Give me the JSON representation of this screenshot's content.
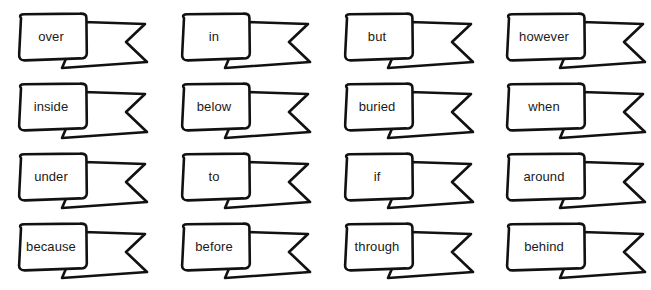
{
  "page": {
    "background_color": "#ffffff",
    "ink_color": "#111111",
    "text_color": "#1a1a1a",
    "columns": 4,
    "rows": 4
  },
  "banners": [
    {
      "id": "banner-over",
      "label": "over",
      "row": 1,
      "col": 1,
      "x": 14,
      "y": 12,
      "wide": false
    },
    {
      "id": "banner-in",
      "label": "in",
      "row": 1,
      "col": 2,
      "x": 177,
      "y": 12,
      "wide": false
    },
    {
      "id": "banner-but",
      "label": "but",
      "row": 1,
      "col": 3,
      "x": 340,
      "y": 12,
      "wide": false
    },
    {
      "id": "banner-however",
      "label": "however",
      "row": 1,
      "col": 4,
      "x": 502,
      "y": 12,
      "wide": true
    },
    {
      "id": "banner-inside",
      "label": "inside",
      "row": 2,
      "col": 1,
      "x": 14,
      "y": 82,
      "wide": false
    },
    {
      "id": "banner-below",
      "label": "below",
      "row": 2,
      "col": 2,
      "x": 177,
      "y": 82,
      "wide": false
    },
    {
      "id": "banner-buried",
      "label": "buried",
      "row": 2,
      "col": 3,
      "x": 340,
      "y": 82,
      "wide": false
    },
    {
      "id": "banner-when",
      "label": "when",
      "row": 2,
      "col": 4,
      "x": 502,
      "y": 82,
      "wide": true
    },
    {
      "id": "banner-under",
      "label": "under",
      "row": 3,
      "col": 1,
      "x": 14,
      "y": 152,
      "wide": false
    },
    {
      "id": "banner-to",
      "label": "to",
      "row": 3,
      "col": 2,
      "x": 177,
      "y": 152,
      "wide": false
    },
    {
      "id": "banner-if",
      "label": "if",
      "row": 3,
      "col": 3,
      "x": 340,
      "y": 152,
      "wide": false
    },
    {
      "id": "banner-around",
      "label": "around",
      "row": 3,
      "col": 4,
      "x": 502,
      "y": 152,
      "wide": true
    },
    {
      "id": "banner-because",
      "label": "because",
      "row": 4,
      "col": 1,
      "x": 14,
      "y": 222,
      "wide": false
    },
    {
      "id": "banner-before",
      "label": "before",
      "row": 4,
      "col": 2,
      "x": 177,
      "y": 222,
      "wide": false
    },
    {
      "id": "banner-through",
      "label": "through",
      "row": 4,
      "col": 3,
      "x": 340,
      "y": 222,
      "wide": false
    },
    {
      "id": "banner-behind",
      "label": "behind",
      "row": 4,
      "col": 4,
      "x": 502,
      "y": 222,
      "wide": true
    }
  ]
}
